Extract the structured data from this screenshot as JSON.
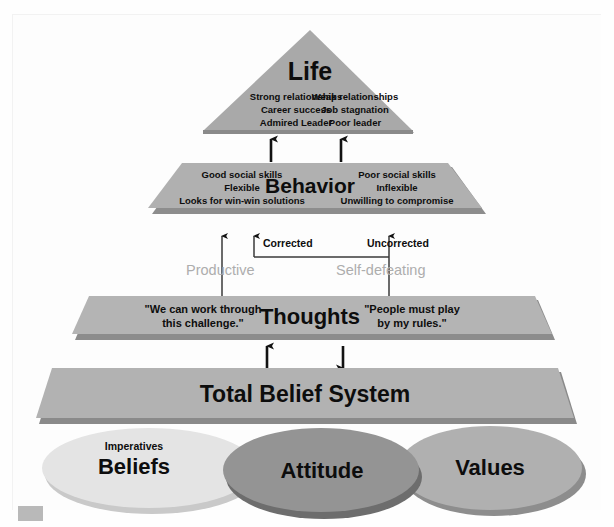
{
  "diagram": {
    "colors": {
      "triangle": "#a9a9a9",
      "triangle_shadow": "#8f8f8f",
      "band": "#b0b0b0",
      "band_shadow": "#909090",
      "slab": "#b4b4b4",
      "slab_shadow": "#8c8c8c",
      "beliefs": "#e2e2e2",
      "beliefs_shadow": "#c9c9c9",
      "attitude": "#949494",
      "attitude_shadow": "#6d6d6d",
      "values": "#b0b0b0",
      "values_shadow": "#8d8d8d",
      "gray_label": "#adadad",
      "text": "#0d0d0d",
      "background": "#fdfdfd",
      "corner_marker": "#b9b9b9"
    },
    "levels": {
      "life": {
        "title": "Life",
        "left_items": [
          "Strong relationships",
          "Career success",
          "Admired Leader"
        ],
        "right_items": [
          "Weak relationships",
          "Job stagnation",
          "Poor leader"
        ]
      },
      "behavior": {
        "title": "Behavior",
        "left_items": [
          "Good social skills",
          "Flexible",
          "Looks for win-win solutions"
        ],
        "right_items": [
          "Poor social skills",
          "Inflexible",
          "Unwilling to compromise"
        ]
      },
      "thoughts": {
        "title": "Thoughts",
        "left_quote_line1": "\"We can work through",
        "left_quote_line2": "this challenge.\"",
        "right_quote_line1": "\"People must play",
        "right_quote_line2": "by my rules.\""
      },
      "belief_system": {
        "title": "Total Belief System"
      }
    },
    "connectors": {
      "corrected": "Corrected",
      "uncorrected": "Uncorrected",
      "productive": "Productive",
      "self_defeating": "Self-defeating"
    },
    "foundation": [
      {
        "id": "beliefs",
        "label": "Beliefs",
        "sublabel": "Imperatives"
      },
      {
        "id": "attitude",
        "label": "Attitude",
        "sublabel": ""
      },
      {
        "id": "values",
        "label": "Values",
        "sublabel": ""
      }
    ]
  }
}
